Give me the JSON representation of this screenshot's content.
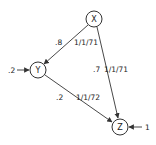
{
  "diagram": {
    "type": "path-diagram",
    "colors": {
      "stroke": "#333333",
      "text": "#222222",
      "background": "#ffffff"
    },
    "nodes": [
      {
        "id": "X",
        "label": "X",
        "cx": 94,
        "cy": 19,
        "r": 8
      },
      {
        "id": "Y",
        "label": "Y",
        "cx": 38,
        "cy": 70,
        "r": 8
      },
      {
        "id": "Z",
        "label": "Z",
        "cx": 120,
        "cy": 127,
        "r": 8
      }
    ],
    "edges": [
      {
        "from": "X",
        "to": "Y",
        "coef": ".8",
        "date": "1/1/71"
      },
      {
        "from": "X",
        "to": "Z",
        "coef": ".7",
        "date": "1/1/71"
      },
      {
        "from": "Y",
        "to": "Z",
        "coef": ".2",
        "date": "1/1/72"
      }
    ],
    "external_inputs": [
      {
        "to": "Y",
        "label": ".2",
        "side": "left"
      },
      {
        "to": "Z",
        "label": "1",
        "side": "right"
      }
    ]
  }
}
